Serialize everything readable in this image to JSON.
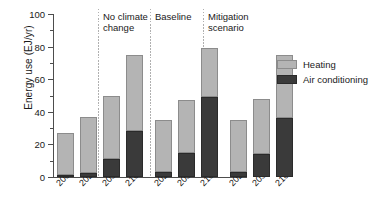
{
  "chart_data": {
    "type": "bar",
    "title": "",
    "xlabel": "",
    "ylabel": "Energy use (EJ/yr)",
    "ylim": [
      0,
      100
    ],
    "ytick_labels": [
      "0",
      "20",
      "40",
      "60",
      "80",
      "100"
    ],
    "ytick_values": [
      0,
      20,
      40,
      60,
      80,
      100
    ],
    "minor_ticks": [
      10,
      30,
      50,
      70,
      90
    ],
    "grid": false,
    "stacked": true,
    "legend_position": "right",
    "categories": [
      "2000",
      "2020",
      "2050",
      "2100",
      "2020",
      "2050",
      "2100",
      "2020",
      "2050",
      "2100"
    ],
    "series": [
      {
        "name": "Heating",
        "color": "#b4b4b4",
        "values": [
          26,
          34.5,
          39,
          47,
          32,
          32.5,
          30,
          32,
          34,
          39
        ]
      },
      {
        "name": "Air conditioning",
        "color": "#3a3a3a",
        "values": [
          1,
          2.5,
          11,
          28,
          3,
          15,
          49,
          3,
          14,
          36
        ]
      }
    ],
    "totals": [
      27,
      37,
      50,
      75,
      35,
      47.5,
      79,
      35,
      48,
      75
    ],
    "groups": [
      {
        "label": "No climate\nchange",
        "categories": [
          "2000",
          "2020",
          "2050",
          "2100"
        ]
      },
      {
        "label": "Baseline",
        "categories": [
          "2020",
          "2050",
          "2100"
        ]
      },
      {
        "label": "Mitigation\nscenario",
        "categories": [
          "2020",
          "2050",
          "2100"
        ]
      }
    ],
    "annotations": [
      {
        "text": "No climate\nchange"
      },
      {
        "text": "Baseline"
      },
      {
        "text": "Mitigation\nscenario"
      }
    ]
  },
  "legend": {
    "items": [
      {
        "label": "Heating",
        "color": "#b4b4b4"
      },
      {
        "label": "Air conditioning",
        "color": "#3a3a3a"
      }
    ]
  },
  "axis": {
    "y_label": "Energy use (EJ/yr)"
  }
}
